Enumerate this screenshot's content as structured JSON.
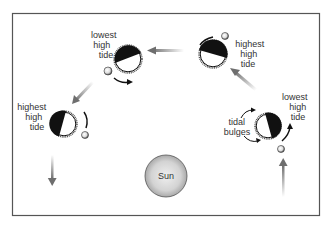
{
  "figure": {
    "colors": {
      "frame": "#555555",
      "earth_dark": "#111111",
      "earth_light": "#ffffff",
      "sun_center": "#e8e8e8",
      "sun_edge": "#a9a9a9",
      "arrow": "#8a8a8a",
      "text": "#333333"
    },
    "sun": {
      "label": "Sun"
    },
    "positions": [
      {
        "id": "top-left",
        "label_lines": [
          "lowest",
          "high",
          "tide"
        ]
      },
      {
        "id": "top-right",
        "label_lines": [
          "highest",
          "high",
          "tide"
        ]
      },
      {
        "id": "left",
        "label_lines": [
          "highest",
          "high",
          "tide"
        ]
      },
      {
        "id": "right",
        "label_lines": [
          "lowest",
          "high",
          "tide"
        ]
      }
    ],
    "annotation": {
      "label_lines": [
        "tidal",
        "bulges"
      ]
    }
  }
}
